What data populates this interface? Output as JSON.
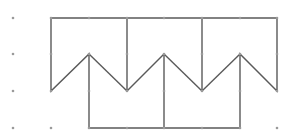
{
  "diagram": {
    "type": "dot-grid-figure",
    "colors": {
      "background": "#ffffff",
      "dot": "#9a9a9a",
      "line": "#5a5a5a"
    },
    "grid": {
      "columns_x": [
        13,
        51,
        89,
        127,
        164,
        202,
        240,
        277
      ],
      "rows_y": [
        18,
        54,
        91,
        128
      ]
    },
    "outline": [
      [
        1,
        0
      ],
      [
        7,
        0
      ],
      [
        7,
        2
      ],
      [
        6,
        1
      ],
      [
        6,
        3
      ],
      [
        2,
        3
      ],
      [
        2,
        1
      ],
      [
        1,
        2
      ],
      [
        1,
        0
      ]
    ],
    "segments": [
      [
        [
          3,
          0
        ],
        [
          3,
          2
        ]
      ],
      [
        [
          5,
          0
        ],
        [
          5,
          2
        ]
      ],
      [
        [
          2,
          1
        ],
        [
          3,
          2
        ]
      ],
      [
        [
          3,
          2
        ],
        [
          4,
          1
        ]
      ],
      [
        [
          4,
          1
        ],
        [
          5,
          2
        ]
      ],
      [
        [
          5,
          2
        ],
        [
          6,
          1
        ]
      ],
      [
        [
          4,
          1
        ],
        [
          4,
          3
        ]
      ]
    ]
  }
}
